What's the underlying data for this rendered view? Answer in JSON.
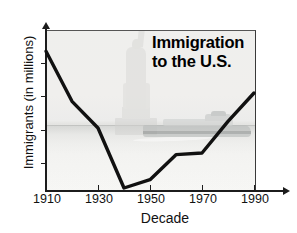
{
  "chart_data": {
    "type": "line",
    "title": "Immigration to the U.S.",
    "title_line1": "Immigration",
    "title_line2": "to the U.S.",
    "xlabel": "Decade",
    "ylabel": "Immigrants (in millions)",
    "x": [
      1910,
      1920,
      1930,
      1940,
      1950,
      1960,
      1970,
      1980,
      1990
    ],
    "values": [
      8.7,
      5.7,
      4.1,
      0.5,
      1.0,
      2.5,
      2.6,
      4.5,
      6.2
    ],
    "series": [
      {
        "name": "Immigrants (in millions)",
        "values": [
          8.7,
          5.7,
          4.1,
          0.5,
          1.0,
          2.5,
          2.6,
          4.5,
          6.2
        ]
      }
    ],
    "xticks": [
      1910,
      1930,
      1950,
      1970,
      1990
    ],
    "xtick_labels": [
      "1910",
      "1930",
      "1950",
      "1970",
      "1990"
    ],
    "yticks": [
      2,
      4,
      6,
      8
    ],
    "ytick_labels": [
      "2",
      "4",
      "6",
      "8"
    ],
    "xlim": [
      1910,
      2000
    ],
    "ylim": [
      0,
      9.4
    ],
    "grid": false,
    "legend": false,
    "line_color": "#111111",
    "background_image": "statue-of-liberty-and-ocean-liner-photo-watermark"
  },
  "axes": {
    "y_title": "Immigrants (in millions)",
    "x_title": "Decade"
  },
  "icons": {
    "statue": "statue-of-liberty-icon",
    "ship": "ocean-liner-icon"
  }
}
